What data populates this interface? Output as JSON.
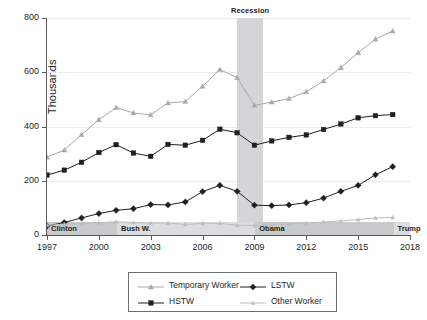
{
  "chart_data": {
    "type": "line",
    "title": "",
    "xlabel": "",
    "ylabel": "Thousands",
    "xlim": [
      1997,
      2018
    ],
    "ylim": [
      0,
      800
    ],
    "x": [
      1997,
      1998,
      1999,
      2000,
      2001,
      2002,
      2003,
      2004,
      2005,
      2006,
      2007,
      2008,
      2009,
      2010,
      2011,
      2012,
      2013,
      2014,
      2015,
      2016,
      2017
    ],
    "xticks": [
      "1997",
      "2000",
      "2003",
      "2006",
      "2009",
      "2012",
      "2015",
      "2018"
    ],
    "xtick_values": [
      1997,
      2000,
      2003,
      2006,
      2009,
      2012,
      2015,
      2018
    ],
    "yticks": [
      "0",
      "200",
      "400",
      "600",
      "800"
    ],
    "ytick_values": [
      0,
      200,
      400,
      600,
      800
    ],
    "grid": "horizontal",
    "legend_position": "bottom",
    "series": [
      {
        "name": "Temporary Worker",
        "color": "#a7a9ac",
        "marker": "triangle",
        "values": [
          287,
          313,
          370,
          425,
          470,
          450,
          443,
          487,
          492,
          548,
          610,
          580,
          478,
          490,
          503,
          528,
          568,
          617,
          672,
          722,
          752
        ]
      },
      {
        "name": "HSTW",
        "color": "#231f20",
        "marker": "square",
        "values": [
          221,
          239,
          268,
          304,
          333,
          302,
          290,
          334,
          331,
          349,
          390,
          377,
          331,
          347,
          360,
          369,
          389,
          409,
          432,
          440,
          444
        ]
      },
      {
        "name": "LSTW",
        "color": "#231f20",
        "marker": "diamond",
        "values": [
          33,
          46,
          63,
          79,
          91,
          97,
          112,
          111,
          122,
          160,
          183,
          161,
          110,
          108,
          111,
          119,
          136,
          161,
          183,
          222,
          252
        ]
      },
      {
        "name": "Other Worker",
        "color": "#bcbec0",
        "marker": "triangle-small",
        "values": [
          36,
          40,
          42,
          45,
          49,
          46,
          44,
          44,
          39,
          43,
          43,
          36,
          35,
          38,
          41,
          44,
          48,
          52,
          57,
          63,
          65
        ]
      }
    ],
    "annotations": {
      "recession": {
        "label": "Recession",
        "start": 2008.0,
        "end": 2009.5,
        "color": "#d4d5d6"
      },
      "presidents": [
        {
          "label": "Clinton",
          "start": 1997,
          "end": 2001.05,
          "color": "#c8c9ca"
        },
        {
          "label": "Bush W.",
          "start": 2001.05,
          "end": 2009.05,
          "color": "#dcdddf"
        },
        {
          "label": "Obama",
          "start": 2009.05,
          "end": 2017.05,
          "color": "#c8c9ca"
        },
        {
          "label": "Trump",
          "start": 2017.05,
          "end": 2018,
          "color": "#dcdddf"
        }
      ]
    }
  },
  "legend": {
    "items": [
      {
        "label": "Temporary Worker"
      },
      {
        "label": "LSTW"
      },
      {
        "label": "HSTW"
      },
      {
        "label": "Other Worker"
      }
    ]
  },
  "axis": {
    "y_title": "Thousands"
  }
}
